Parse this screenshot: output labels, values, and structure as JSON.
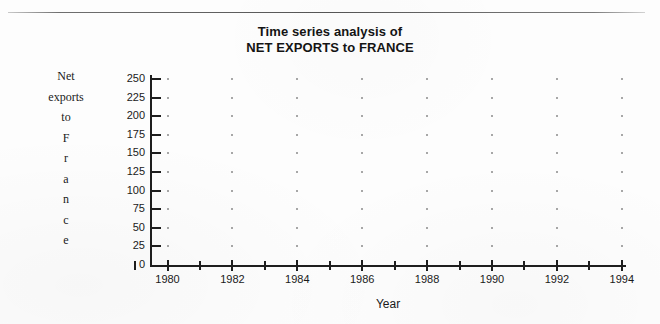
{
  "figure": {
    "title_line1": "Time series analysis of",
    "title_line2": "NET EXPORTS to FRANCE",
    "xlabel": "Year",
    "ylabel_lines": [
      "Net",
      "exports",
      "to",
      "F",
      "r",
      "a",
      "n",
      "c",
      "e"
    ],
    "ylabel_full": "Net exports to France"
  },
  "chart_data": {
    "type": "scatter",
    "title": "Time series analysis of NET EXPORTS to FRANCE",
    "xlabel": "Year",
    "ylabel": "Net exports to France",
    "xlim": [
      1979,
      1994.9
    ],
    "ylim": [
      0,
      255
    ],
    "grid": "dots",
    "legend": null,
    "series": [
      {
        "name": "Net exports to France",
        "x": [],
        "y": []
      }
    ],
    "x_major_ticks": [
      1980,
      1982,
      1984,
      1986,
      1988,
      1990,
      1992,
      1994
    ],
    "x_major_tick_labels": [
      "1980",
      "1982",
      "1984",
      "1986",
      "1988",
      "1990",
      "1992",
      "1994"
    ],
    "x_minor_ticks": [
      1979,
      1981,
      1983,
      1985,
      1987,
      1989,
      1991,
      1993
    ],
    "y_ticks": [
      0,
      25,
      50,
      75,
      100,
      125,
      150,
      175,
      200,
      225,
      250
    ],
    "y_tick_labels": [
      "0",
      "25",
      "50",
      "75",
      "100",
      "125",
      "150",
      "175",
      "200",
      "225",
      "250"
    ],
    "grid_dot_columns": [
      1980,
      1982,
      1984,
      1986,
      1988,
      1990,
      1992,
      1994
    ],
    "grid_dot_rows": [
      25,
      50,
      75,
      100,
      125,
      150,
      175,
      200,
      225,
      250
    ],
    "note": "Plot region is empty - no data points are drawn"
  },
  "colors": {
    "background": "#fdfdfd",
    "ink": "#1a1a1a",
    "grid_dot": "#8a8a8a",
    "rule": "#555555"
  }
}
